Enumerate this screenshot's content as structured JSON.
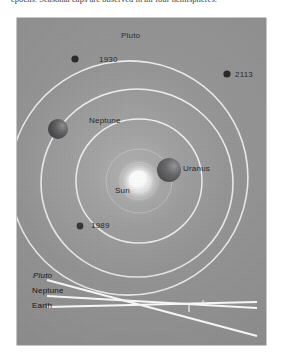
{
  "caption": {
    "text": "epochs. Seasonal caps are observed in all four hemispheres."
  },
  "figure": {
    "background_color": "#9a9a9a",
    "orbit_color": "#f2f2f2",
    "sun": {
      "label": "Sun",
      "color": "#ffffff",
      "cx": 122,
      "cy": 163,
      "radius": 11
    },
    "orbits": [
      {
        "name": "Uranus",
        "cx": 122,
        "cy": 163,
        "rx": 63,
        "ry": 62
      },
      {
        "name": "Neptune",
        "cx": 120,
        "cy": 165,
        "rx": 96,
        "ry": 94
      },
      {
        "name": "Pluto",
        "cx": 112,
        "cy": 160,
        "rx": 119,
        "ry": 117,
        "eccentric": true
      }
    ],
    "planets": [
      {
        "name": "Neptune",
        "label": "Neptune",
        "cx": 41,
        "cy": 111,
        "radius": 10,
        "color": "#4e4e50"
      },
      {
        "name": "Uranus",
        "label": "Uranus",
        "cx": 152,
        "cy": 152,
        "radius": 12,
        "color": "#4e4e50"
      }
    ],
    "markers": [
      {
        "label": "1930",
        "cx": 58,
        "cy": 41,
        "radius": 3.6,
        "color": "#2b2b2b"
      },
      {
        "label": "2113",
        "cx": 210,
        "cy": 56,
        "radius": 3.6,
        "color": "#2b2b2b"
      },
      {
        "label": "1989",
        "cx": 63,
        "cy": 208,
        "radius": 3.4,
        "color": "#2b2b2b"
      }
    ],
    "labels": {
      "pluto_orbit": "Pluto"
    }
  },
  "inset": {
    "line_color": "#f5f5f5",
    "rows": [
      {
        "label": "Pluto",
        "italic": true
      },
      {
        "label": "Neptune",
        "italic": false
      },
      {
        "label": "Earth",
        "italic": false
      }
    ]
  }
}
